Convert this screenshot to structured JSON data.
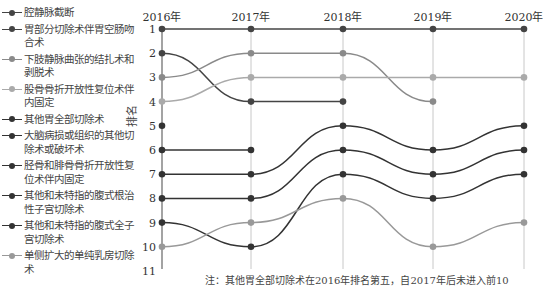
{
  "chart_data": {
    "type": "line",
    "title": "",
    "xlabel": "",
    "ylabel": "排名",
    "categories": [
      "2016年",
      "2017年",
      "2018年",
      "2019年",
      "2020年"
    ],
    "yticks": [
      1,
      2,
      3,
      4,
      5,
      6,
      7,
      8,
      9,
      10,
      11
    ],
    "ylim": [
      1,
      11
    ],
    "y_inverted": true,
    "grid": "vertical",
    "legend_position": "left",
    "series": [
      {
        "name": "腔静脉截断",
        "color": "#444444",
        "values": [
          1,
          1,
          1,
          1,
          1
        ]
      },
      {
        "name": "胃部分切除术伴胃空肠吻合术",
        "color": "#444444",
        "values": [
          2,
          4,
          4,
          null,
          null
        ]
      },
      {
        "name": "下肢静脉曲张的结扎术和剥脱术",
        "color": "#8a8a8a",
        "values": [
          3,
          2,
          2,
          4,
          null
        ]
      },
      {
        "name": "股骨骨折开放性复位术伴内固定",
        "color": "#aaaaaa",
        "values": [
          4,
          3,
          3,
          3,
          3
        ]
      },
      {
        "name": "其他胃全部切除术",
        "color": "#333333",
        "values": [
          5,
          null,
          null,
          null,
          null
        ]
      },
      {
        "name": "大脑病损或组织的其他切除术或破坏术",
        "color": "#333333",
        "values": [
          6,
          6,
          null,
          null,
          null
        ]
      },
      {
        "name": "胫骨和腓骨骨折开放性复位术伴内固定",
        "color": "#333333",
        "values": [
          7,
          7,
          5,
          6,
          5
        ]
      },
      {
        "name": "其他和未特指的腹式根治性子宫切除术",
        "color": "#333333",
        "values": [
          8,
          8,
          6,
          7,
          6
        ]
      },
      {
        "name": "其他和未特指的腹式全子宫切除术",
        "color": "#333333",
        "values": [
          9,
          10,
          7,
          8,
          7
        ]
      },
      {
        "name": "单侧扩大的单纯乳房切除术",
        "color": "#999999",
        "values": [
          10,
          9,
          8,
          10,
          9
        ]
      }
    ],
    "note": "注：其他胃全部切除术在2016年排名第五，自2017年后未进入前10"
  },
  "legend": {
    "items": [
      {
        "label": "腔静脉截断"
      },
      {
        "label": "胃部分切除术伴胃空肠吻合术"
      },
      {
        "label": "下肢静脉曲张的结扎术和剥脱术"
      },
      {
        "label": "股骨骨折开放性复位术伴内固定"
      },
      {
        "label": "其他胃全部切除术"
      },
      {
        "label": "大脑病损或组织的其他切除术或破坏术"
      },
      {
        "label": "胫骨和腓骨骨折开放性复位术伴内固定"
      },
      {
        "label": "其他和未特指的腹式根治性子宫切除术"
      },
      {
        "label": "其他和未特指的腹式全子宫切除术"
      },
      {
        "label": "单侧扩大的单纯乳房切除术"
      }
    ]
  }
}
